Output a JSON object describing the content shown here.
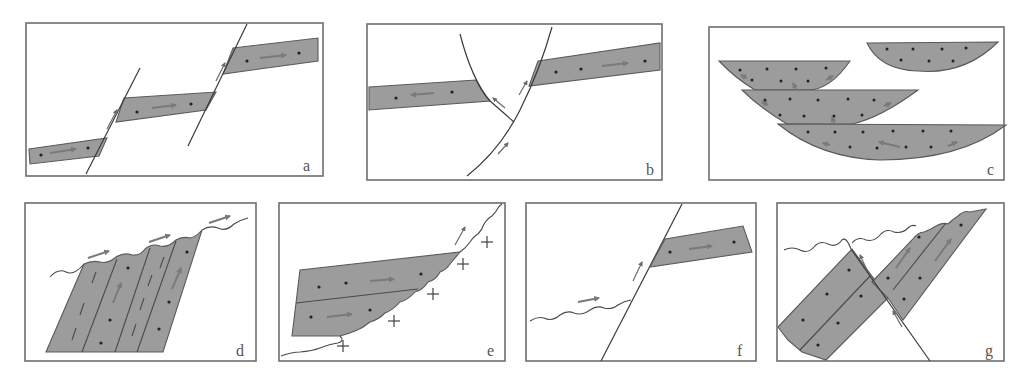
{
  "figure": {
    "panels": [
      {
        "id": "a",
        "label": "a",
        "content": "Planar bed offset stepwise by two parallel reverse faults; slip arrows along faults, displacement arrows within bed segments"
      },
      {
        "id": "b",
        "label": "b",
        "content": "Bed separated by two curved converging faults forming a wedge; bed segments move apart (arrows left and right)"
      },
      {
        "id": "c",
        "label": "c",
        "content": "Four stacked lens-shaped (spoon-shaped) dotted bodies overlapping one another with small internal arrows"
      },
      {
        "id": "d",
        "label": "d",
        "content": "Steeply tilted layered block with internal dashed lines, truncated at top by a wavy erosional surface with slip arrows"
      },
      {
        "id": "e",
        "label": "e",
        "content": "Two-layer bed overlying a stepped/wavy contact against crystalline basement marked by crosses"
      },
      {
        "id": "f",
        "label": "f",
        "content": "Wavy surface cut by an inclined fault; bed segment preserved in hanging wall on right"
      },
      {
        "id": "g",
        "label": "g",
        "content": "Tilted two-layer bed offset by an inclined fault, truncated by wavy erosional surface at top"
      }
    ]
  },
  "colors": {
    "bed_fill": "#9c9c9c",
    "outline": "#5a5a5a",
    "arrow": "#7a7a7a",
    "frame": "#6e6e6e",
    "background": "#ffffff"
  }
}
